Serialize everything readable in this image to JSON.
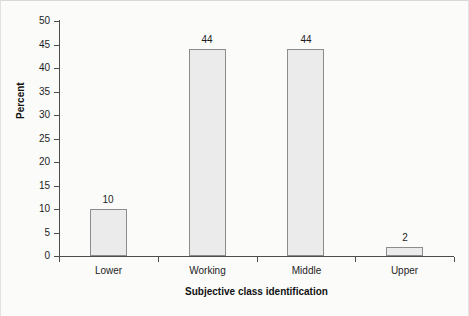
{
  "chart_data": {
    "type": "bar",
    "title": "",
    "subtitle": "",
    "xlabel": "Subjective class identification",
    "ylabel": "Percent",
    "categories": [
      "Lower",
      "Working",
      "Middle",
      "Upper"
    ],
    "values": [
      10,
      44,
      44,
      2
    ],
    "data_labels": [
      "10",
      "44",
      "44",
      "2"
    ],
    "ylim": [
      0,
      50
    ],
    "ytick_labels": [
      "50",
      "45",
      "40",
      "35",
      "30",
      "25",
      "20",
      "15",
      "10",
      "5",
      "0"
    ],
    "ytick_values": [
      50,
      45,
      40,
      35,
      30,
      25,
      20,
      15,
      10,
      5,
      0
    ],
    "grid": false,
    "legend": false,
    "legend_position": "none",
    "bar_fill_color": "#ebebeb",
    "bar_border_color": "#8c8c8c",
    "axis_color": "#4d4d4d",
    "background_color": "#fbfbfa",
    "text_color": "#1d1d1d"
  }
}
